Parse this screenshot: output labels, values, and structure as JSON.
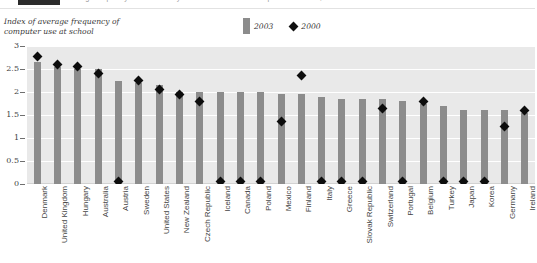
{
  "header": {
    "badge_label": "",
    "caption": "Average frequency with which 15-year-old students used computers at school, 2000 and 2003"
  },
  "axis_title": "Index of average frequency of computer use at school",
  "legend": {
    "entries": [
      {
        "label": "2003",
        "type": "bar",
        "color": "#8c8c8c"
      },
      {
        "label": "2000",
        "type": "diamond",
        "color": "#111111"
      }
    ]
  },
  "chart_data": {
    "type": "bar",
    "title": "Average frequency with which 15-year-old students used computers at school, 2000 and 2003",
    "xlabel": "",
    "ylabel": "Index of average frequency of computer use at school",
    "ylim": [
      0,
      3
    ],
    "yticks": [
      0,
      0.5,
      1,
      1.5,
      2,
      2.5,
      3
    ],
    "ytick_labels": [
      "0",
      "0.5",
      "1",
      "1.5",
      "2",
      "2.5",
      "3"
    ],
    "grid": true,
    "legend_position": "top-center",
    "categories": [
      "Denmark",
      "United Kingdom",
      "Hungary",
      "Australia",
      "Austria",
      "Sweden",
      "United States",
      "New Zealand",
      "Czech Republic",
      "Iceland",
      "Canada",
      "Poland",
      "Mexico",
      "Finland",
      "Italy",
      "Greece",
      "Slovak Republic",
      "Switzerland",
      "Portugal",
      "Belgium",
      "Turkey",
      "Japan",
      "Korea",
      "Germany",
      "Ireland"
    ],
    "series": [
      {
        "name": "2003",
        "type": "bar",
        "color": "#8c8c8c",
        "values": [
          2.65,
          2.55,
          2.5,
          2.5,
          2.25,
          2.2,
          2.15,
          2.0,
          2.0,
          2.0,
          2.0,
          2.0,
          1.95,
          1.95,
          1.9,
          1.85,
          1.85,
          1.85,
          1.8,
          1.75,
          1.7,
          1.6,
          1.6,
          1.6,
          1.55
        ]
      },
      {
        "name": "2000",
        "type": "diamond",
        "color": "#0d0d0d",
        "values": [
          2.78,
          2.6,
          2.55,
          2.4,
          0.05,
          2.25,
          2.05,
          1.95,
          1.8,
          0.05,
          0.05,
          0.05,
          1.35,
          2.35,
          0.05,
          0.05,
          0.05,
          1.65,
          0.05,
          1.8,
          0.05,
          0.05,
          0.05,
          1.25,
          1.6
        ]
      }
    ]
  }
}
